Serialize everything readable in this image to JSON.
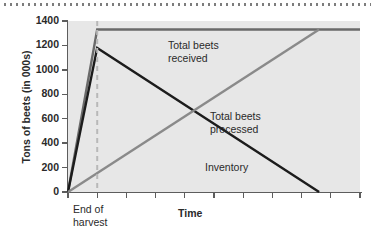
{
  "chart_data": {
    "type": "line",
    "title": "",
    "xlabel": "Time",
    "ylabel": "Tons of beets (in 000s)",
    "ylim": [
      0,
      1400
    ],
    "yticks": [
      0,
      200,
      400,
      600,
      800,
      1000,
      1200,
      1400
    ],
    "ytick_labels": [
      "0",
      "200",
      "400",
      "600",
      "800",
      "1000",
      "1200",
      "1400"
    ],
    "xlim": [
      0,
      10
    ],
    "xticks": [
      0,
      1,
      2,
      3,
      4,
      5,
      6,
      7,
      8,
      9,
      10
    ],
    "xtick_labels": [
      "",
      "",
      "",
      "",
      "",
      "",
      "",
      "",
      "",
      "",
      ""
    ],
    "grid": false,
    "legend": "none",
    "annotations": [
      {
        "name": "end-of-harvest",
        "text": "End of harvest",
        "x": 1,
        "y": 0
      },
      {
        "name": "total-beets-received",
        "text": "Total beets received",
        "x": 4.2,
        "y": 1230
      },
      {
        "name": "total-beets-processed",
        "text": "Total beets processed",
        "x": 5.8,
        "y": 670
      },
      {
        "name": "inventory",
        "text": "Inventory",
        "x": 5.6,
        "y": 270
      }
    ],
    "series": [
      {
        "name": "Total beets received",
        "color": "#6a6a6a",
        "x": [
          0,
          1,
          10
        ],
        "values": [
          0,
          1330,
          1330
        ]
      },
      {
        "name": "Inventory",
        "color": "#1c1c1c",
        "x": [
          0,
          1,
          8.6
        ],
        "values": [
          0,
          1180,
          0
        ]
      },
      {
        "name": "Total beets processed",
        "color": "#8a8a8a",
        "x": [
          0,
          8.6
        ],
        "values": [
          0,
          1330
        ]
      }
    ],
    "markers": [
      {
        "name": "end-of-harvest-guide",
        "type": "vline",
        "x": 1,
        "style": "dashed",
        "color": "#b8b8b8"
      }
    ],
    "plot_background": "#e7e7e7",
    "axis_color": "#5d5d5d"
  },
  "y_axis": {
    "title": "Tons of beets (in 000s)",
    "ticks": [
      "1400",
      "1200",
      "1000",
      "800",
      "600",
      "400",
      "200",
      "0"
    ]
  },
  "x_axis": {
    "title": "Time",
    "first_tick_label": "End of harvest"
  },
  "series_labels": {
    "received_line1": "Total beets",
    "received_line2": "received",
    "processed_line1": "Total beets",
    "processed_line2": "processed",
    "inventory": "Inventory"
  }
}
